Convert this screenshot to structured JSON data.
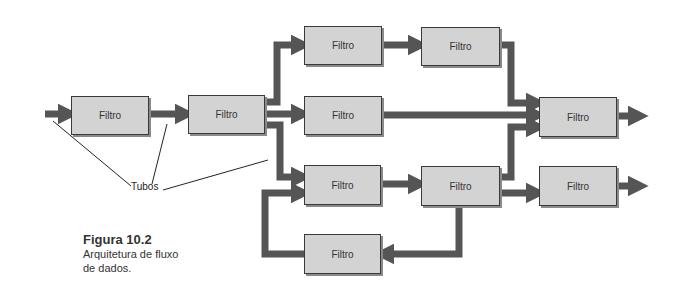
{
  "figure": {
    "number_label": "Figura 10.2",
    "caption": "Arquitetura de fluxo de dados.",
    "caption_line1": "Arquitetura de fluxo",
    "caption_line2": "de dados."
  },
  "annotation": {
    "label": "Tubos"
  },
  "filters": [
    {
      "id": "f1",
      "label": "Filtro"
    },
    {
      "id": "f2",
      "label": "Filtro"
    },
    {
      "id": "f3",
      "label": "Filtro"
    },
    {
      "id": "f4",
      "label": "Filtro"
    },
    {
      "id": "f5",
      "label": "Filtro"
    },
    {
      "id": "f6",
      "label": "Filtro"
    },
    {
      "id": "f7",
      "label": "Filtro"
    },
    {
      "id": "f8",
      "label": "Filtro"
    },
    {
      "id": "f9",
      "label": "Filtro"
    },
    {
      "id": "f10",
      "label": "Filtro"
    }
  ],
  "colors": {
    "box_fill": "#d3d3d3",
    "box_border": "#3a3a3a",
    "pipe": "#555555"
  }
}
